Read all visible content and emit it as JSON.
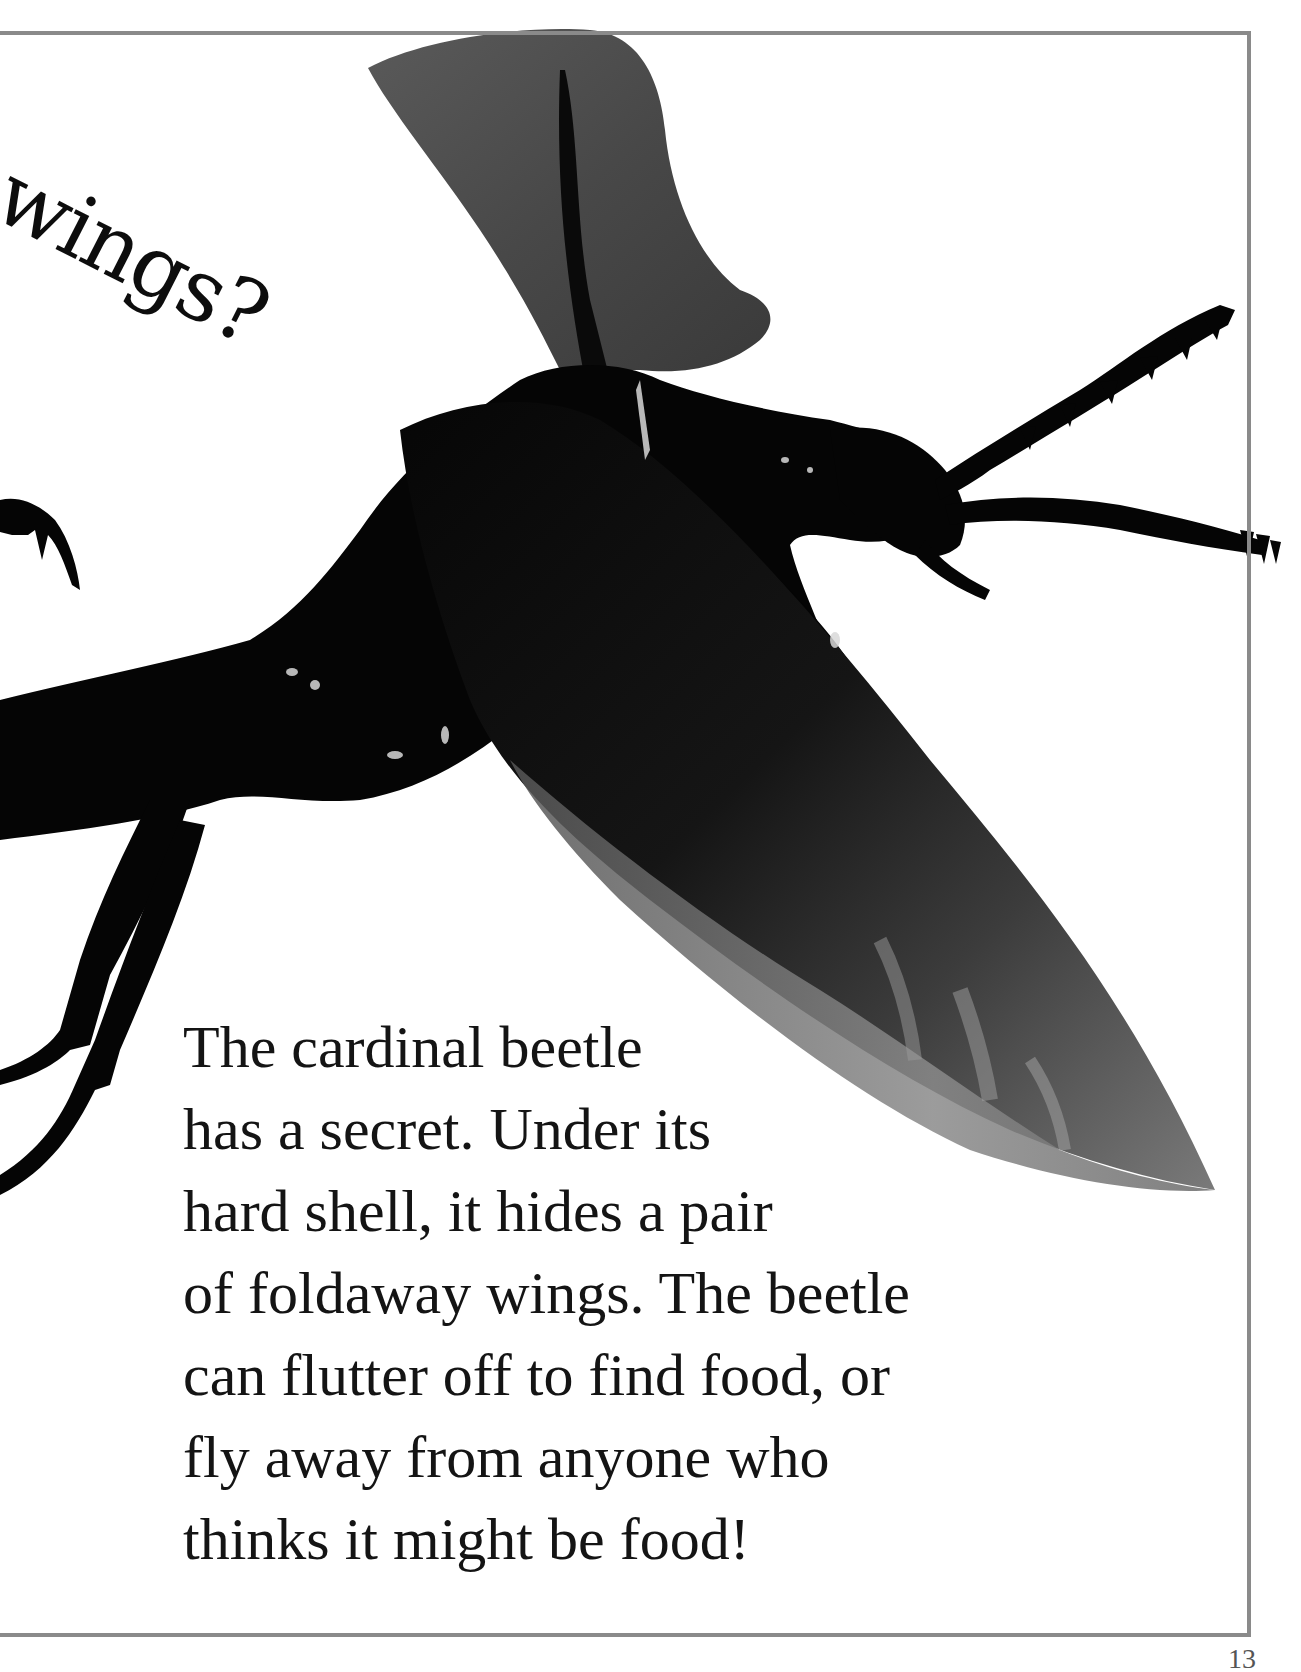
{
  "page": {
    "heading": "wings?",
    "body_lines": [
      "The cardinal beetle",
      "has a secret. Under its",
      "hard shell, it hides a pair",
      "of foldaway wings. The beetle",
      "can flutter off to find food, or",
      "fly away from anyone who",
      "thinks it might be food!"
    ],
    "page_number": "13",
    "image": {
      "subject": "cardinal beetle in flight with wings unfolded",
      "icon": "beetle-photo"
    }
  },
  "colors": {
    "frame": "#8a8a8a",
    "text": "#141414",
    "background": "#ffffff",
    "beetle_body": "#050505",
    "beetle_wing": "#4a4a4a"
  }
}
